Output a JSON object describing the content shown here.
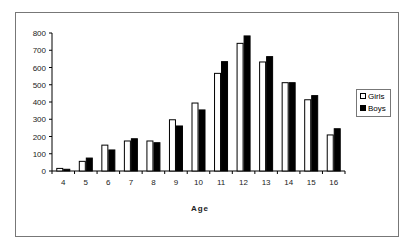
{
  "chart_data": {
    "type": "bar",
    "title": "",
    "xlabel": "Age",
    "ylabel": "",
    "ylim": [
      0,
      800
    ],
    "yticks": [
      0,
      100,
      200,
      300,
      400,
      500,
      600,
      700,
      800
    ],
    "categories": [
      "4",
      "5",
      "6",
      "7",
      "8",
      "9",
      "10",
      "11",
      "12",
      "13",
      "14",
      "15",
      "16"
    ],
    "series": [
      {
        "name": "Girls",
        "color": "#ffffff",
        "values": [
          15,
          56,
          150,
          174,
          174,
          297,
          394,
          566,
          740,
          632,
          512,
          413,
          209
        ]
      },
      {
        "name": "Boys",
        "color": "#000000",
        "values": [
          10,
          75,
          122,
          187,
          164,
          261,
          354,
          634,
          783,
          663,
          512,
          437,
          245
        ]
      }
    ],
    "legend_position": "right",
    "grid": false
  },
  "legend": {
    "girls_label": "Girls",
    "boys_label": "Boys"
  },
  "axis": {
    "x_title": "Age"
  }
}
